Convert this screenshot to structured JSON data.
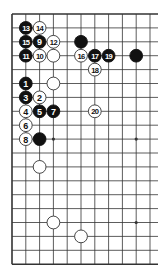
{
  "diagram": {
    "type": "go-board-partial",
    "board_size": 19,
    "visible_columns": 11,
    "visible_rows": 19,
    "open_edge": "right",
    "origin_px": [
      12,
      14
    ],
    "spacing_px": [
      13.8,
      13.9
    ],
    "colors": {
      "line": "#333333",
      "black": "#111111",
      "white": "#ffffff",
      "white_stroke": "#333333",
      "background": "#ffffff"
    },
    "star_points": [
      [
        3,
        3
      ],
      [
        3,
        9
      ],
      [
        3,
        15
      ],
      [
        9,
        3
      ],
      [
        9,
        9
      ],
      [
        9,
        15
      ]
    ],
    "stones": [
      {
        "col": 1,
        "row": 1,
        "color": "black",
        "label": "13"
      },
      {
        "col": 2,
        "row": 1,
        "color": "white",
        "label": "14"
      },
      {
        "col": 1,
        "row": 2,
        "color": "black",
        "label": "15"
      },
      {
        "col": 2,
        "row": 2,
        "color": "black",
        "label": "9"
      },
      {
        "col": 3,
        "row": 2,
        "color": "white",
        "label": "12"
      },
      {
        "col": 1,
        "row": 3,
        "color": "black",
        "label": "11"
      },
      {
        "col": 2,
        "row": 3,
        "color": "white",
        "label": "10"
      },
      {
        "col": 3,
        "row": 3,
        "color": "white",
        "label": ""
      },
      {
        "col": 5,
        "row": 2,
        "color": "black",
        "label": ""
      },
      {
        "col": 5,
        "row": 3,
        "color": "white",
        "label": "16"
      },
      {
        "col": 6,
        "row": 3,
        "color": "black",
        "label": "17"
      },
      {
        "col": 7,
        "row": 3,
        "color": "black",
        "label": "19"
      },
      {
        "col": 9,
        "row": 3,
        "color": "black",
        "label": ""
      },
      {
        "col": 6,
        "row": 4,
        "color": "white",
        "label": "18"
      },
      {
        "col": 1,
        "row": 5,
        "color": "black",
        "label": "1"
      },
      {
        "col": 3,
        "row": 5,
        "color": "white",
        "label": ""
      },
      {
        "col": 1,
        "row": 6,
        "color": "black",
        "label": "3"
      },
      {
        "col": 2,
        "row": 6,
        "color": "white",
        "label": "2"
      },
      {
        "col": 1,
        "row": 7,
        "color": "white",
        "label": "4"
      },
      {
        "col": 2,
        "row": 7,
        "color": "black",
        "label": "5"
      },
      {
        "col": 3,
        "row": 7,
        "color": "black",
        "label": "7"
      },
      {
        "col": 6,
        "row": 7,
        "color": "white",
        "label": "20"
      },
      {
        "col": 1,
        "row": 8,
        "color": "white",
        "label": "6"
      },
      {
        "col": 1,
        "row": 9,
        "color": "white",
        "label": "8"
      },
      {
        "col": 2,
        "row": 9,
        "color": "black",
        "label": ""
      },
      {
        "col": 2,
        "row": 11,
        "color": "white",
        "label": ""
      },
      {
        "col": 3,
        "row": 15,
        "color": "white",
        "label": ""
      },
      {
        "col": 5,
        "row": 16,
        "color": "white",
        "label": ""
      }
    ]
  }
}
